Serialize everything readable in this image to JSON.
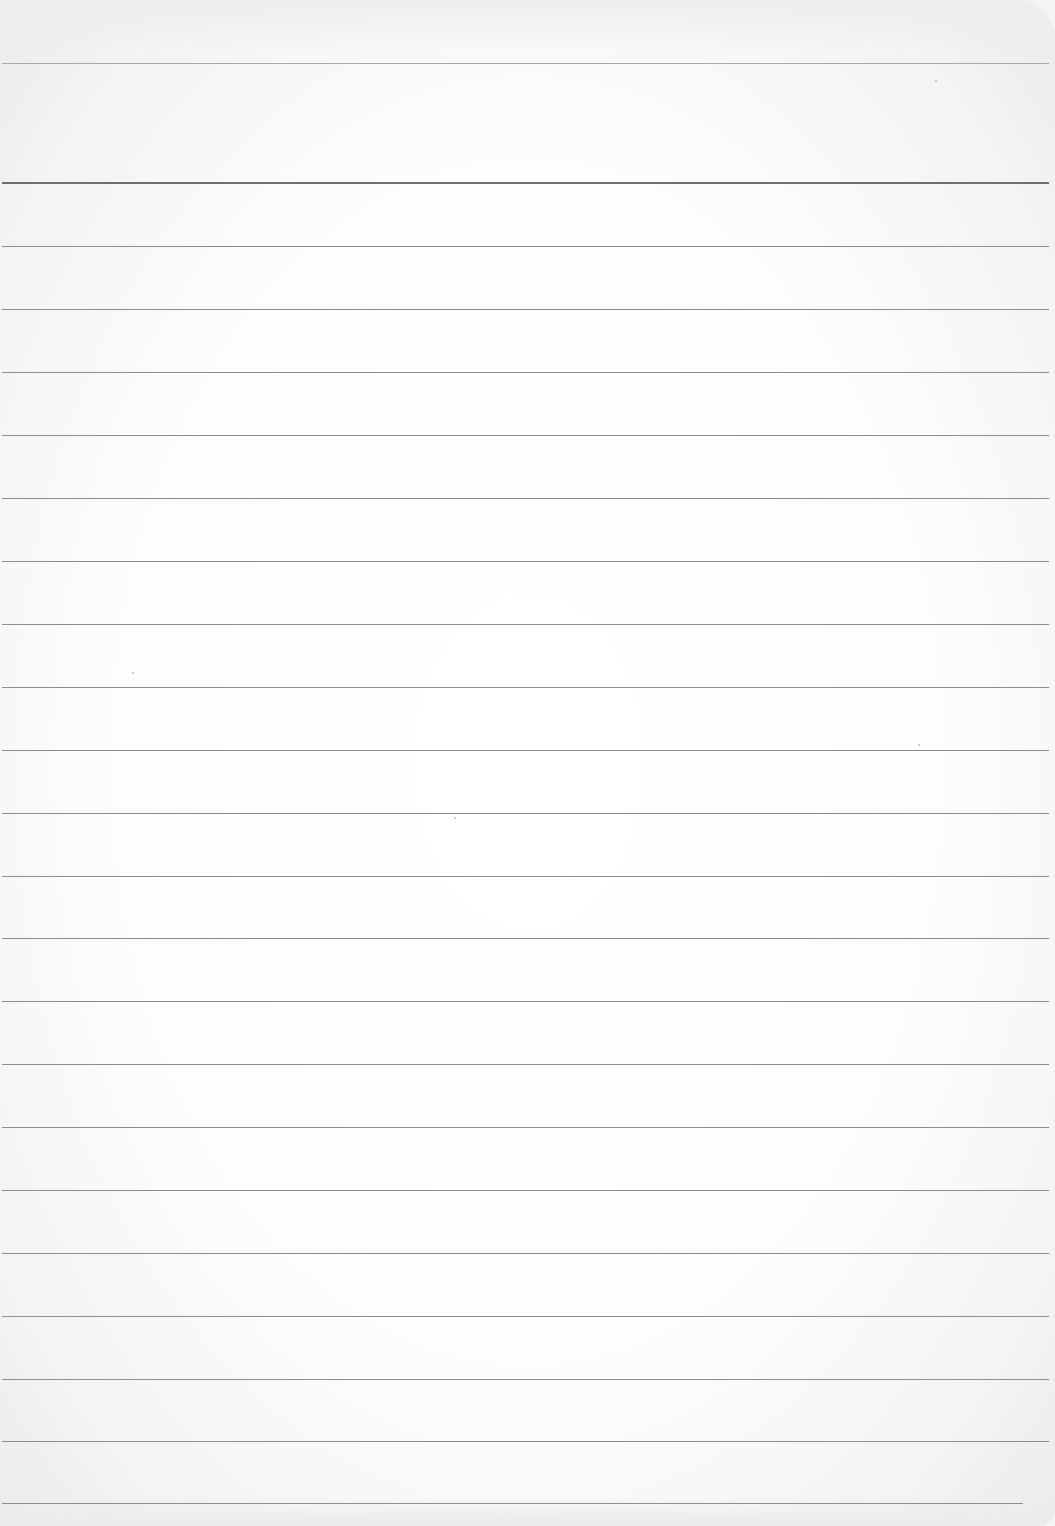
{
  "document": {
    "type": "ruled-notebook-page",
    "written_content": "",
    "paper_color": "#fdfdfd",
    "rule_color": "#8e8e8c",
    "header_rule_color": "#6f6f6d",
    "top_margin_rule_y": 63,
    "header_rule_y": 183,
    "line_spacing_px": 63,
    "rule_positions_y": [
      246,
      309,
      372,
      435,
      498,
      561,
      624,
      687,
      750,
      813,
      876,
      938,
      1001,
      1064,
      1127,
      1190,
      1253,
      1316,
      1379,
      1441,
      1503
    ]
  }
}
